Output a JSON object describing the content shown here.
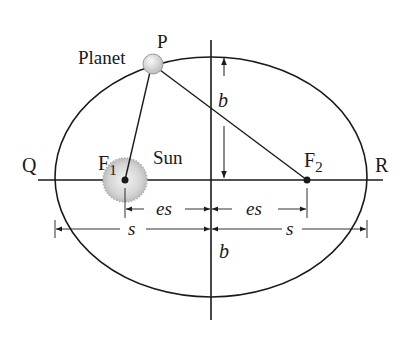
{
  "diagram": {
    "labels": {
      "planet": "Planet",
      "P": "P",
      "sun": "Sun",
      "Q": "Q",
      "R": "R",
      "F1_main": "F",
      "F1_sub": "1",
      "F2_main": "F",
      "F2_sub": "2",
      "b_top": "b",
      "b_bottom": "b",
      "es_left": "es",
      "es_right": "es",
      "s_left": "s",
      "s_right": "s"
    },
    "geometry": {
      "ellipse": {
        "cx": 211,
        "cy": 177,
        "rx": 156,
        "ry": 120
      },
      "major_axis_y": 180,
      "minor_axis_x": 211,
      "focus1": {
        "x": 125,
        "y": 180
      },
      "focus2": {
        "x": 307,
        "y": 180
      },
      "planet": {
        "x": 153,
        "y": 64
      }
    },
    "colors": {
      "line": "#1a1a1a",
      "sun_fill": "#d9d9d9",
      "planet_fill": "#e0e0e0",
      "background": "#ffffff"
    }
  }
}
